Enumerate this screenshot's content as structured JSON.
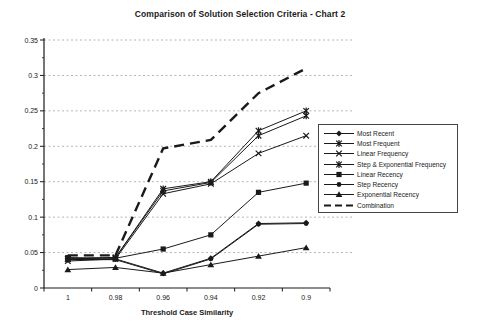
{
  "title": "Comparison of Solution Selection Criteria - Chart 2",
  "colors": {
    "line": "#1a1a1a",
    "grid": "#b4b4b4",
    "axis": "#1a1a1a",
    "background": "#ffffff",
    "legend_border": "#444444"
  },
  "chart_data": {
    "type": "line",
    "title": "Comparison of Solution Selection Criteria - Chart 2",
    "xlabel": "Threshold Case Similarity",
    "ylabel": "",
    "categories": [
      1,
      0.98,
      0.96,
      0.94,
      0.92,
      0.9
    ],
    "x_tick_labels": [
      "1",
      "0.98",
      "0.96",
      "0.94",
      "0.92",
      "0.9"
    ],
    "y_ticks": [
      0,
      0.05,
      0.1,
      0.15,
      0.2,
      0.25,
      0.3,
      0.35
    ],
    "y_tick_labels": [
      "0",
      "0.05",
      "0.1",
      "0.15",
      "0.2",
      "0.25",
      "0.3",
      "0.35"
    ],
    "ylim": [
      0,
      0.35
    ],
    "grid": "horizontal-dashed",
    "legend_position": "right-overlay",
    "series": [
      {
        "name": "Most Recent",
        "marker": "diamond",
        "line": "solid",
        "values": [
          0.04,
          0.041,
          0.021,
          0.042,
          0.091,
          0.092
        ]
      },
      {
        "name": "Most Frequent",
        "marker": "star",
        "line": "solid",
        "values": [
          0.041,
          0.043,
          0.14,
          0.15,
          0.222,
          0.25
        ]
      },
      {
        "name": "Linear Frequency",
        "marker": "x",
        "line": "solid",
        "values": [
          0.038,
          0.041,
          0.133,
          0.147,
          0.19,
          0.215
        ]
      },
      {
        "name": "Step & Exponential Frequency",
        "marker": "star",
        "line": "solid",
        "values": [
          0.041,
          0.043,
          0.137,
          0.149,
          0.215,
          0.243
        ]
      },
      {
        "name": "Linear Recency",
        "marker": "square",
        "line": "solid",
        "values": [
          0.043,
          0.042,
          0.055,
          0.075,
          0.135,
          0.148
        ]
      },
      {
        "name": "Step Recency",
        "marker": "circle",
        "line": "solid",
        "values": [
          0.04,
          0.04,
          0.02,
          0.041,
          0.09,
          0.091
        ]
      },
      {
        "name": "Exponential Recency",
        "marker": "triangle",
        "line": "solid",
        "values": [
          0.026,
          0.029,
          0.021,
          0.033,
          0.045,
          0.057
        ]
      },
      {
        "name": "Combination",
        "marker": "none",
        "line": "dashed",
        "values": [
          0.046,
          0.046,
          0.197,
          0.209,
          0.275,
          0.31
        ]
      }
    ]
  }
}
